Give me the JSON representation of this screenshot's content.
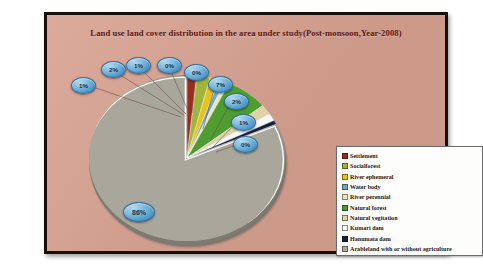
{
  "chart_title": "Land use land cover distribution in the area under study(Post-monsoon,Year-2008)",
  "colors": {
    "background": "#d8a291",
    "frame_border": "#15100e",
    "title_text": "#5c1410",
    "legend_bg": "#fdfdfb",
    "legend_border": "#6b6b6b",
    "bubble_fill": "#4f95c4",
    "bubble_text": "#10304a"
  },
  "legend": {
    "items": [
      {
        "label": "Settlement",
        "color": "#9e2a1e"
      },
      {
        "label": "Socialforest",
        "color": "#9fb53c"
      },
      {
        "label": "River ephemeral",
        "color": "#e8c21a"
      },
      {
        "label": "Water body",
        "color": "#6fa8c8"
      },
      {
        "label": "River perennial",
        "color": "#efe6b8"
      },
      {
        "label": "Natural forest",
        "color": "#4f9d31"
      },
      {
        "label": "Natural vegitation",
        "color": "#ded2a6"
      },
      {
        "label": "Kumari dam",
        "color": "#f7f7f5"
      },
      {
        "label": "Hanumata dam",
        "color": "#17213f"
      },
      {
        "label": "Arableland with or without agriculture",
        "color": "#a9a79c"
      }
    ]
  },
  "chart_data": {
    "type": "pie",
    "title": "Land use land cover distribution in the area under study(Post-monsoon,Year-2008)",
    "legend_position": "right",
    "value_unit": "percent",
    "categories": [
      "Settlement",
      "Socialforest",
      "River ephemeral",
      "Water body",
      "River perennial",
      "Natural forest",
      "Natural vegitation",
      "Kumari dam",
      "Hanumata dam",
      "Arableland with or without agriculture"
    ],
    "values": [
      1,
      2,
      1,
      0,
      0,
      7,
      2,
      1,
      0,
      86
    ],
    "labels": [
      "1%",
      "2%",
      "1%",
      "0%",
      "0%",
      "7%",
      "2%",
      "1%",
      "0%",
      "86%"
    ],
    "colors": [
      "#9e2a1e",
      "#9fb53c",
      "#e8c21a",
      "#6fa8c8",
      "#efe6b8",
      "#4f9d31",
      "#ded2a6",
      "#f7f7f5",
      "#17213f",
      "#a9a79c"
    ]
  },
  "data_labels": [
    {
      "text": "1%",
      "x": 18,
      "y": 20
    },
    {
      "text": "2%",
      "x": 48,
      "y": 4
    },
    {
      "text": "1%",
      "x": 73,
      "y": 0
    },
    {
      "text": "0%",
      "x": 104,
      "y": 0
    },
    {
      "text": "0%",
      "x": 131,
      "y": 7
    },
    {
      "text": "7%",
      "x": 155,
      "y": 19
    },
    {
      "text": "2%",
      "x": 171,
      "y": 36
    },
    {
      "text": "1%",
      "x": 178,
      "y": 57
    },
    {
      "text": "0%",
      "x": 180,
      "y": 79
    },
    {
      "text": "86%",
      "x": 70,
      "y": 145
    }
  ]
}
